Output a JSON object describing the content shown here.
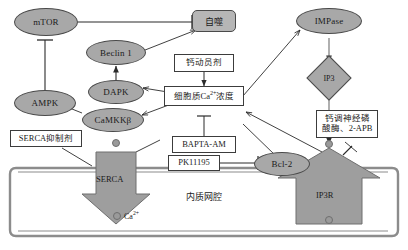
{
  "diagram": {
    "colors": {
      "node_fill": "#a8a8a8",
      "node_stroke": "#4a4a4a",
      "box_fill": "#ffffff",
      "box_stroke": "#3c3c3c",
      "membrane": "#8c8c8c",
      "shape_fill": "#9e9e9e",
      "ion_dot": "#9a9a9a",
      "background": "#ffffff"
    },
    "nodes": {
      "mtor": "mTOR",
      "ampk": "AMPK",
      "beclin1": "Beclin 1",
      "dapk": "DAPK",
      "camkkb": "CaMKKβ",
      "autophagy": "自噬",
      "ca_mobilizer": "钙动员剂",
      "cytosolic_ca": "细胞质Ca2+浓度",
      "bapta_am": "BAPTA-AM",
      "pk11195": "PK11195",
      "serca_inhibitor": "SERCA抑制剂",
      "serca": "SERCA",
      "bcl2": "Bcl-2",
      "ip3r": "IP3R",
      "impase": "IMPase",
      "ip3": "IP3",
      "calcineurin_apb_line1": "钙调神经磷",
      "calcineurin_apb_line2": "酸酶、2-APB",
      "er_lumen": "内质网腔",
      "calcium_ion": "Ca2+"
    }
  }
}
